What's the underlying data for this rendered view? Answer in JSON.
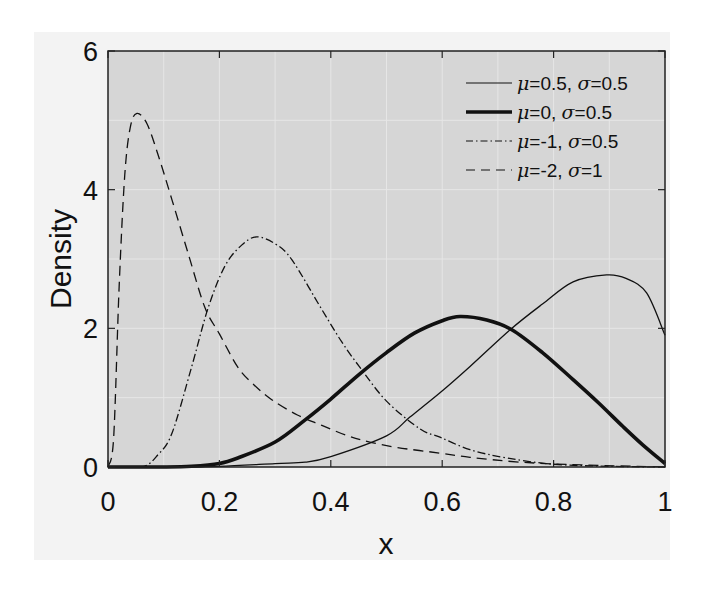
{
  "chart_data": {
    "type": "line",
    "title": "",
    "xlabel": "x",
    "ylabel": "Density",
    "xlim": [
      0,
      1
    ],
    "ylim": [
      0,
      6
    ],
    "xticks": [
      0,
      0.2,
      0.4,
      0.6,
      0.8,
      1
    ],
    "xtick_labels": [
      "0",
      "0.2",
      "0.4",
      "0.6",
      "0.8",
      "1"
    ],
    "yticks": [
      0,
      2,
      4,
      6
    ],
    "ytick_labels": [
      "0",
      "2",
      "4",
      "6"
    ],
    "grid": true,
    "legend_position": "upper right",
    "background_color": "#d6d6d6",
    "series": [
      {
        "name": "μ=0.5, σ=0.5",
        "mu": "0.5",
        "sigma": "0.5",
        "style": "solid",
        "width": 1.3,
        "color": "#111111",
        "x": [
          0,
          0.1,
          0.2,
          0.3,
          0.354,
          0.4,
          0.5,
          0.542,
          0.596,
          0.65,
          0.722,
          0.78,
          0.835,
          0.895,
          0.93,
          0.967,
          1.0
        ],
        "y": [
          0,
          0,
          0.01,
          0.05,
          0.07,
          0.15,
          0.45,
          0.72,
          1.07,
          1.45,
          1.98,
          2.35,
          2.67,
          2.77,
          2.72,
          2.51,
          1.9
        ]
      },
      {
        "name": "μ=0, σ=0.5",
        "mu": "0",
        "sigma": "0.5",
        "style": "solid",
        "width": 3.6,
        "color": "#111111",
        "x": [
          0,
          0.1,
          0.15,
          0.2,
          0.233,
          0.3,
          0.354,
          0.4,
          0.45,
          0.5,
          0.55,
          0.6,
          0.632,
          0.68,
          0.725,
          0.78,
          0.835,
          0.88,
          0.925,
          0.96,
          1.0
        ],
        "y": [
          0,
          0,
          0.01,
          0.05,
          0.13,
          0.36,
          0.68,
          0.98,
          1.33,
          1.65,
          1.93,
          2.11,
          2.17,
          2.12,
          1.98,
          1.65,
          1.26,
          0.93,
          0.58,
          0.32,
          0.05
        ]
      },
      {
        "name": "μ=-1, σ=0.5",
        "mu": "-1",
        "sigma": "0.5",
        "style": "dashdot",
        "width": 1.3,
        "color": "#111111",
        "x": [
          0,
          0.061,
          0.09,
          0.115,
          0.15,
          0.18,
          0.21,
          0.24,
          0.267,
          0.3,
          0.33,
          0.384,
          0.42,
          0.452,
          0.5,
          0.56,
          0.596,
          0.65,
          0.716,
          0.8,
          0.9,
          1.0
        ],
        "y": [
          0,
          0,
          0.18,
          0.49,
          1.44,
          2.3,
          2.9,
          3.2,
          3.32,
          3.22,
          2.99,
          2.27,
          1.8,
          1.44,
          0.95,
          0.55,
          0.43,
          0.25,
          0.13,
          0.04,
          0.01,
          0
        ]
      },
      {
        "name": "μ=-2, σ=1",
        "mu": "-2",
        "sigma": "1",
        "style": "dashed",
        "width": 1.3,
        "color": "#111111",
        "x": [
          0,
          0.01,
          0.02,
          0.03,
          0.04,
          0.052,
          0.07,
          0.09,
          0.115,
          0.145,
          0.174,
          0.2,
          0.233,
          0.26,
          0.294,
          0.34,
          0.384,
          0.43,
          0.47,
          0.52,
          0.596,
          0.65,
          0.74,
          0.85,
          1.0
        ],
        "y": [
          0,
          0.4,
          2.6,
          4.2,
          4.9,
          5.1,
          4.95,
          4.5,
          3.85,
          3.05,
          2.3,
          1.92,
          1.44,
          1.2,
          0.97,
          0.75,
          0.6,
          0.45,
          0.36,
          0.28,
          0.2,
          0.14,
          0.07,
          0.03,
          0
        ]
      }
    ]
  },
  "legend": {
    "items": [
      {
        "mu_label": "μ",
        "mu_value": "=0.5, ",
        "sigma_label": "σ",
        "sigma_value": "=0.5"
      },
      {
        "mu_label": "μ",
        "mu_value": "=0, ",
        "sigma_label": "σ",
        "sigma_value": "=0.5"
      },
      {
        "mu_label": "μ",
        "mu_value": "=-1, ",
        "sigma_label": "σ",
        "sigma_value": "=0.5"
      },
      {
        "mu_label": "μ",
        "mu_value": "=-2, ",
        "sigma_label": "σ",
        "sigma_value": "=1"
      }
    ]
  },
  "axes": {
    "xlabel": "x",
    "ylabel": "Density",
    "xtick_labels": [
      "0",
      "0.2",
      "0.4",
      "0.6",
      "0.8",
      "1"
    ],
    "ytick_labels": [
      "0",
      "2",
      "4",
      "6"
    ]
  }
}
